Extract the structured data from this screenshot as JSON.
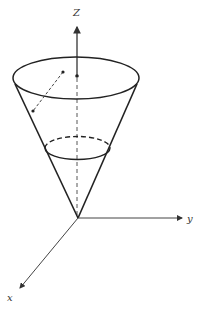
{
  "diagram": {
    "type": "3d-cone-in-axes",
    "axis_labels": {
      "z": "Z",
      "y": "y",
      "x": "x"
    },
    "colors": {
      "stroke": "#222222",
      "axis": "#444444",
      "background": "#ffffff"
    }
  }
}
